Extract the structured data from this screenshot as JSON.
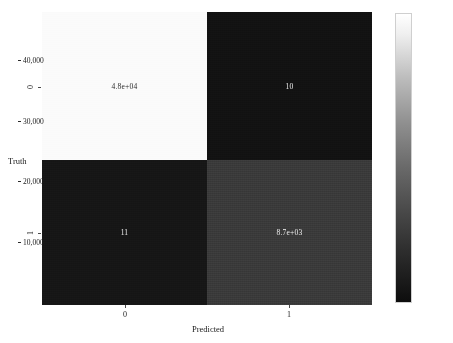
{
  "chart_data": {
    "type": "heatmap",
    "title": "",
    "xlabel": "Predicted",
    "ylabel": "Truth",
    "x_categories": [
      "0",
      "1"
    ],
    "y_categories": [
      "0",
      "1"
    ],
    "cells": [
      {
        "row": "0",
        "col": "0",
        "label": "4.8e+04",
        "value": 48000,
        "color": "#fbfbfb",
        "text_color": "#2a2a2a"
      },
      {
        "row": "0",
        "col": "1",
        "label": "10",
        "value": 10,
        "color": "#121212",
        "text_color": "#f2f2f2"
      },
      {
        "row": "1",
        "col": "0",
        "label": "11",
        "value": 11,
        "color": "#161616",
        "text_color": "#f2f2f2"
      },
      {
        "row": "1",
        "col": "1",
        "label": "8.7e+03",
        "value": 8700,
        "color": "#3a3a3a",
        "text_color": "#f0f0f0"
      }
    ],
    "colorbar": {
      "ticks": [
        "10,000",
        "20,000",
        "30,000",
        "40,000"
      ],
      "tick_values": [
        10000,
        20000,
        30000,
        40000
      ],
      "vmin": 10,
      "vmax": 48000,
      "colormap": "grayscale",
      "low_color": "#0d0d0d",
      "high_color": "#ffffff",
      "position": "right"
    },
    "grid": false,
    "legend": "none"
  },
  "axes": {
    "x_label": "Predicted",
    "y_label": "Truth",
    "x_ticks": [
      {
        "text": "0",
        "x": 125
      },
      {
        "text": "1",
        "x": 289
      }
    ],
    "y_ticks": [
      {
        "text": "0",
        "y": 87
      },
      {
        "text": "1",
        "y": 233
      }
    ]
  }
}
